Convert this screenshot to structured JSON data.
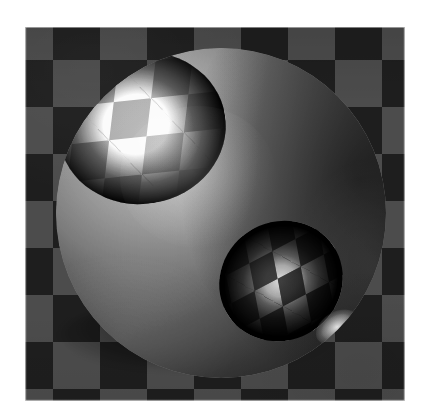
{
  "figure": {
    "kind": "rendered-3d-image",
    "caption": "",
    "alt_text": "Shaded sphere with checkerboard-patterned specular highlights on a gray checkerboard ground plane",
    "canvas": {
      "width": 427,
      "height": 415,
      "background_color": "#ffffff"
    },
    "image_plate": {
      "left": 25,
      "top": 27,
      "width": 380,
      "height": 374,
      "border_color": "#ffffff"
    }
  },
  "scene": {
    "background": {
      "name": "checkerboard-ground-plane",
      "pattern": "checkerboard",
      "light_square_color": "#6d6d6d",
      "dark_square_color": "#2b2b2b",
      "square_size_px": 47,
      "columns": 9,
      "rows": 9
    },
    "sphere": {
      "name": "shaded-sphere",
      "center_x": 221,
      "center_y": 213,
      "diameter_px": 330,
      "base_color": "#9a9a9a",
      "lit_color": "#cfcfcf",
      "shadow_color": "#272727",
      "light_direction": "upper-left"
    },
    "highlights": [
      {
        "name": "primary-specular-highlight",
        "pattern": "checkerboard",
        "position": "upper-left",
        "center_x": 142,
        "center_y": 128,
        "width_px": 168,
        "height_px": 152,
        "peak_color": "#ffffff",
        "checker_size_px": 38
      },
      {
        "name": "secondary-specular-highlight",
        "pattern": "checkerboard",
        "position": "lower-right",
        "center_x": 281,
        "center_y": 281,
        "width_px": 126,
        "height_px": 118,
        "peak_color": "#f8f8f8",
        "checker_size_px": 27
      }
    ],
    "contact_shadow": {
      "name": "contact-shadow",
      "center_x": 196,
      "center_y": 335,
      "width_px": 268,
      "height_px": 70,
      "color": "#000000"
    },
    "texture": {
      "name": "halftone-grain",
      "type": "print-dither",
      "opacity": 0.4
    }
  }
}
